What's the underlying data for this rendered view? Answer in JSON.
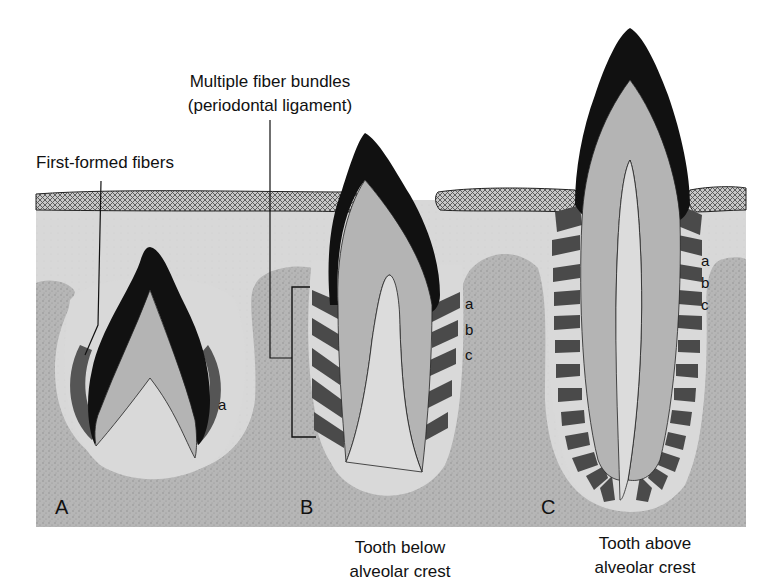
{
  "figure": {
    "panels": [
      {
        "id": "A",
        "letter": "A",
        "caption": ""
      },
      {
        "id": "B",
        "letter": "B",
        "caption_line1": "Tooth below",
        "caption_line2": "alveolar crest"
      },
      {
        "id": "C",
        "letter": "C",
        "caption_line1": "Tooth above",
        "caption_line2": "alveolar crest"
      }
    ],
    "labels": {
      "first_formed": "First-formed fibers",
      "multiple_line1": "Multiple fiber bundles",
      "multiple_line2": "(periodontal ligament)"
    },
    "fiber_group_labels": {
      "A": [
        "a"
      ],
      "B": [
        "a",
        "b",
        "c"
      ],
      "C": [
        "a",
        "b",
        "c"
      ]
    },
    "colors": {
      "enamel": "#111111",
      "dentin": "#b4b4b4",
      "pulp": "#dcdcdc",
      "connective_tissue": "#d6d6d6",
      "bone": "#b0b0b0",
      "gingiva": "#9a9a9a",
      "fiber": "#4a4a4a"
    }
  }
}
